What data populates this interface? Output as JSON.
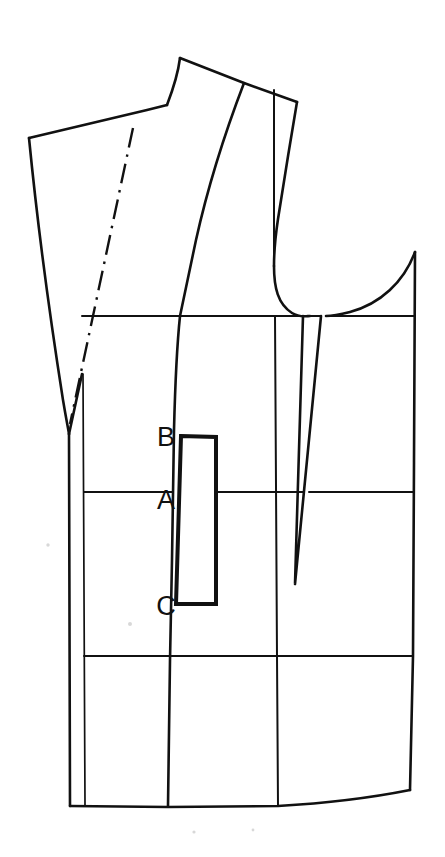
{
  "diagram": {
    "kind": "technical-line-drawing",
    "background_color": "#ffffff",
    "line_color": "#111111",
    "canvas": {
      "width": 445,
      "height": 857
    },
    "labels": [
      {
        "id": "B",
        "text": "B",
        "x": 166,
        "y": 446,
        "meaning": "pocket-top-point"
      },
      {
        "id": "A",
        "text": "A",
        "x": 166,
        "y": 509,
        "meaning": "waist-line-point"
      },
      {
        "id": "C",
        "text": "C",
        "x": 166,
        "y": 615,
        "meaning": "pocket-bottom-point"
      }
    ],
    "pocket": {
      "name": "welt-pocket-box",
      "top_label": "B",
      "mid_label": "A",
      "bottom_label": "C",
      "corners": [
        [
          181,
          436
        ],
        [
          216,
          436
        ],
        [
          216,
          604
        ],
        [
          176,
          604
        ]
      ]
    },
    "guide_lines": {
      "chest_line_y": 316,
      "waist_line_y": 492,
      "hip_line_y": 656,
      "hem_line_y": 806
    },
    "parts": [
      {
        "name": "front-outline",
        "type": "outline"
      },
      {
        "name": "shoulder-seam",
        "type": "outline"
      },
      {
        "name": "neckline-curve",
        "type": "outline"
      },
      {
        "name": "lapel-break-edge",
        "type": "outline"
      },
      {
        "name": "roll-line",
        "type": "dash-dot"
      },
      {
        "name": "front-edge-facing-line",
        "type": "thin"
      },
      {
        "name": "princess-seam",
        "type": "outline"
      },
      {
        "name": "armhole-curve",
        "type": "outline"
      },
      {
        "name": "side-panel",
        "type": "outline"
      },
      {
        "name": "side-body-dart",
        "type": "outline"
      },
      {
        "name": "chest-guide-line",
        "type": "construction"
      },
      {
        "name": "waist-guide-line",
        "type": "construction"
      },
      {
        "name": "hip-guide-line",
        "type": "construction"
      },
      {
        "name": "hem-line",
        "type": "outline"
      }
    ]
  }
}
